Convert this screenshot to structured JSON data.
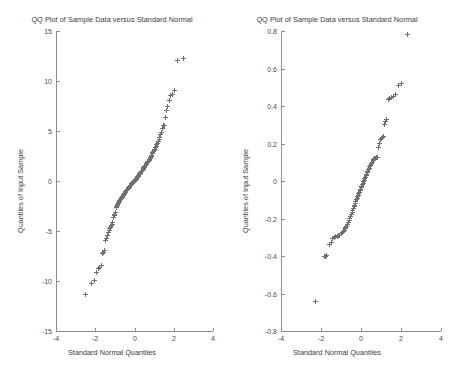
{
  "figure": {
    "width": 449,
    "height": 379,
    "background": "#ffffff",
    "marker_color": "#707070",
    "axis_color": "#8c8c8c",
    "text_color": "#3a3a3a"
  },
  "chart_data": [
    {
      "type": "scatter",
      "panel": "left",
      "title": "QQ Plot of Sample Data versus Standard Normal",
      "xlabel": "Standard Normal Quantiles",
      "ylabel": "Quantiles of Input Sample",
      "xlim": [
        -4,
        4
      ],
      "ylim": [
        -15,
        15
      ],
      "xticks": [
        -4,
        -2,
        0,
        2,
        4
      ],
      "xticklabels": [
        "-4",
        "-2",
        "0",
        "2",
        "4"
      ],
      "yticks": [
        -15,
        -10,
        -5,
        0,
        5,
        10,
        15
      ],
      "yticklabels": [
        "-15",
        "-10",
        "-5",
        "0",
        "5",
        "10",
        "15"
      ],
      "grid": false,
      "legend": null,
      "marker": "+",
      "x": [
        -2.52,
        -2.18,
        -2.02,
        -1.93,
        -1.83,
        -1.76,
        -1.7,
        -1.63,
        -1.58,
        -1.52,
        -1.47,
        -1.42,
        -1.38,
        -1.33,
        -1.29,
        -1.25,
        -1.21,
        -1.17,
        -1.14,
        -1.1,
        -1.07,
        -1.03,
        -1.0,
        -0.97,
        -0.94,
        -0.91,
        -0.88,
        -0.85,
        -0.82,
        -0.79,
        -0.76,
        -0.74,
        -0.71,
        -0.68,
        -0.66,
        -0.63,
        -0.61,
        -0.58,
        -0.56,
        -0.53,
        -0.51,
        -0.48,
        -0.46,
        -0.44,
        -0.41,
        -0.39,
        -0.37,
        -0.34,
        -0.32,
        -0.3,
        -0.28,
        -0.26,
        -0.23,
        -0.21,
        -0.19,
        -0.17,
        -0.15,
        -0.13,
        -0.11,
        -0.08,
        -0.06,
        -0.04,
        -0.02,
        0.0,
        0.02,
        0.04,
        0.06,
        0.08,
        0.11,
        0.13,
        0.15,
        0.17,
        0.19,
        0.21,
        0.23,
        0.26,
        0.28,
        0.3,
        0.32,
        0.34,
        0.37,
        0.39,
        0.41,
        0.44,
        0.46,
        0.48,
        0.51,
        0.53,
        0.56,
        0.58,
        0.61,
        0.63,
        0.66,
        0.68,
        0.71,
        0.74,
        0.76,
        0.79,
        0.82,
        0.85,
        0.88,
        0.91,
        0.94,
        0.97,
        1.0,
        1.03,
        1.07,
        1.1,
        1.14,
        1.17,
        1.21,
        1.25,
        1.29,
        1.33,
        1.38,
        1.42,
        1.47,
        1.52,
        1.58,
        1.63,
        1.7,
        1.76,
        1.83,
        1.93,
        2.02,
        2.18,
        2.52
      ],
      "y": [
        -11.35,
        -10.2,
        -9.95,
        -9.1,
        -8.75,
        -8.6,
        -8.4,
        -7.2,
        -7.1,
        -6.95,
        -5.9,
        -5.7,
        -5.45,
        -5.1,
        -4.9,
        -4.75,
        -4.6,
        -4.45,
        -4.3,
        -4.15,
        -3.6,
        -3.45,
        -3.3,
        -3.15,
        -2.6,
        -2.5,
        -2.4,
        -2.3,
        -2.2,
        -2.1,
        -2.0,
        -1.92,
        -1.84,
        -1.76,
        -1.68,
        -1.6,
        -1.52,
        -1.45,
        -1.38,
        -1.31,
        -1.24,
        -1.17,
        -1.1,
        -1.04,
        -0.98,
        -0.92,
        -0.86,
        -0.8,
        -0.74,
        -0.68,
        -0.62,
        -0.56,
        -0.5,
        -0.45,
        -0.4,
        -0.35,
        -0.3,
        -0.25,
        -0.2,
        -0.15,
        -0.1,
        -0.06,
        -0.02,
        0.02,
        0.06,
        0.1,
        0.15,
        0.2,
        0.26,
        0.32,
        0.38,
        0.44,
        0.5,
        0.56,
        0.62,
        0.68,
        0.74,
        0.8,
        0.86,
        0.92,
        0.98,
        1.04,
        1.1,
        1.17,
        1.24,
        1.31,
        1.38,
        1.45,
        1.52,
        1.6,
        1.68,
        1.76,
        1.84,
        1.92,
        2.0,
        2.1,
        2.2,
        2.3,
        2.4,
        2.5,
        2.6,
        2.72,
        2.84,
        2.96,
        3.08,
        3.2,
        3.34,
        3.48,
        3.62,
        3.78,
        3.95,
        4.15,
        4.4,
        4.65,
        4.9,
        5.3,
        5.55,
        5.6,
        6.4,
        7.1,
        7.5,
        8.05,
        8.6,
        8.7,
        9.1,
        12.1,
        12.3
      ]
    },
    {
      "type": "scatter",
      "panel": "right",
      "title": "QQ Plot of Sample Data versus Standard Normal",
      "xlabel": "Standard Normal Quantiles",
      "ylabel": "Quantiles of Input Sample",
      "xlim": [
        -4,
        4
      ],
      "ylim": [
        -0.8,
        0.8
      ],
      "xticks": [
        -4,
        -2,
        0,
        2,
        4
      ],
      "xticklabels": [
        "-4",
        "-2",
        "0",
        "2",
        "4"
      ],
      "yticks": [
        -0.8,
        -0.6,
        -0.4,
        -0.2,
        0,
        0.2,
        0.4,
        0.6,
        0.8
      ],
      "yticklabels": [
        "-0.8",
        "-0.6",
        "-0.4",
        "-0.2",
        "0",
        "0.2",
        "0.4",
        "0.6",
        "0.8"
      ],
      "grid": false,
      "legend": null,
      "marker": "+",
      "x": [
        -2.3,
        -1.85,
        -1.78,
        -1.72,
        -1.6,
        -1.5,
        -1.42,
        -1.35,
        -1.28,
        -1.2,
        -1.13,
        -1.06,
        -1.0,
        -0.95,
        -0.9,
        -0.85,
        -0.8,
        -0.76,
        -0.72,
        -0.68,
        -0.64,
        -0.6,
        -0.56,
        -0.52,
        -0.49,
        -0.45,
        -0.42,
        -0.38,
        -0.35,
        -0.32,
        -0.29,
        -0.26,
        -0.23,
        -0.2,
        -0.17,
        -0.14,
        -0.11,
        -0.08,
        -0.05,
        -0.02,
        0.01,
        0.04,
        0.07,
        0.1,
        0.13,
        0.16,
        0.19,
        0.22,
        0.25,
        0.28,
        0.31,
        0.34,
        0.37,
        0.41,
        0.44,
        0.48,
        0.52,
        0.56,
        0.6,
        0.64,
        0.68,
        0.72,
        0.76,
        0.8,
        0.85,
        0.9,
        0.95,
        1.0,
        1.06,
        1.1,
        1.15,
        1.2,
        1.28,
        1.35,
        1.42,
        1.5,
        1.6,
        1.72,
        1.85,
        2.02,
        2.3
      ],
      "y": [
        -0.64,
        -0.405,
        -0.4,
        -0.395,
        -0.34,
        -0.33,
        -0.305,
        -0.3,
        -0.298,
        -0.295,
        -0.292,
        -0.288,
        -0.282,
        -0.275,
        -0.268,
        -0.262,
        -0.255,
        -0.248,
        -0.24,
        -0.232,
        -0.22,
        -0.208,
        -0.198,
        -0.188,
        -0.178,
        -0.168,
        -0.158,
        -0.148,
        -0.138,
        -0.128,
        -0.118,
        -0.11,
        -0.1,
        -0.092,
        -0.084,
        -0.076,
        -0.068,
        -0.06,
        -0.052,
        -0.044,
        -0.036,
        -0.028,
        -0.02,
        -0.012,
        -0.004,
        0.004,
        0.012,
        0.02,
        0.028,
        0.036,
        0.044,
        0.052,
        0.06,
        0.068,
        0.076,
        0.084,
        0.092,
        0.1,
        0.108,
        0.115,
        0.12,
        0.122,
        0.124,
        0.126,
        0.18,
        0.2,
        0.22,
        0.228,
        0.232,
        0.24,
        0.3,
        0.32,
        0.33,
        0.435,
        0.44,
        0.445,
        0.45,
        0.46,
        0.51,
        0.52,
        0.78
      ]
    }
  ]
}
